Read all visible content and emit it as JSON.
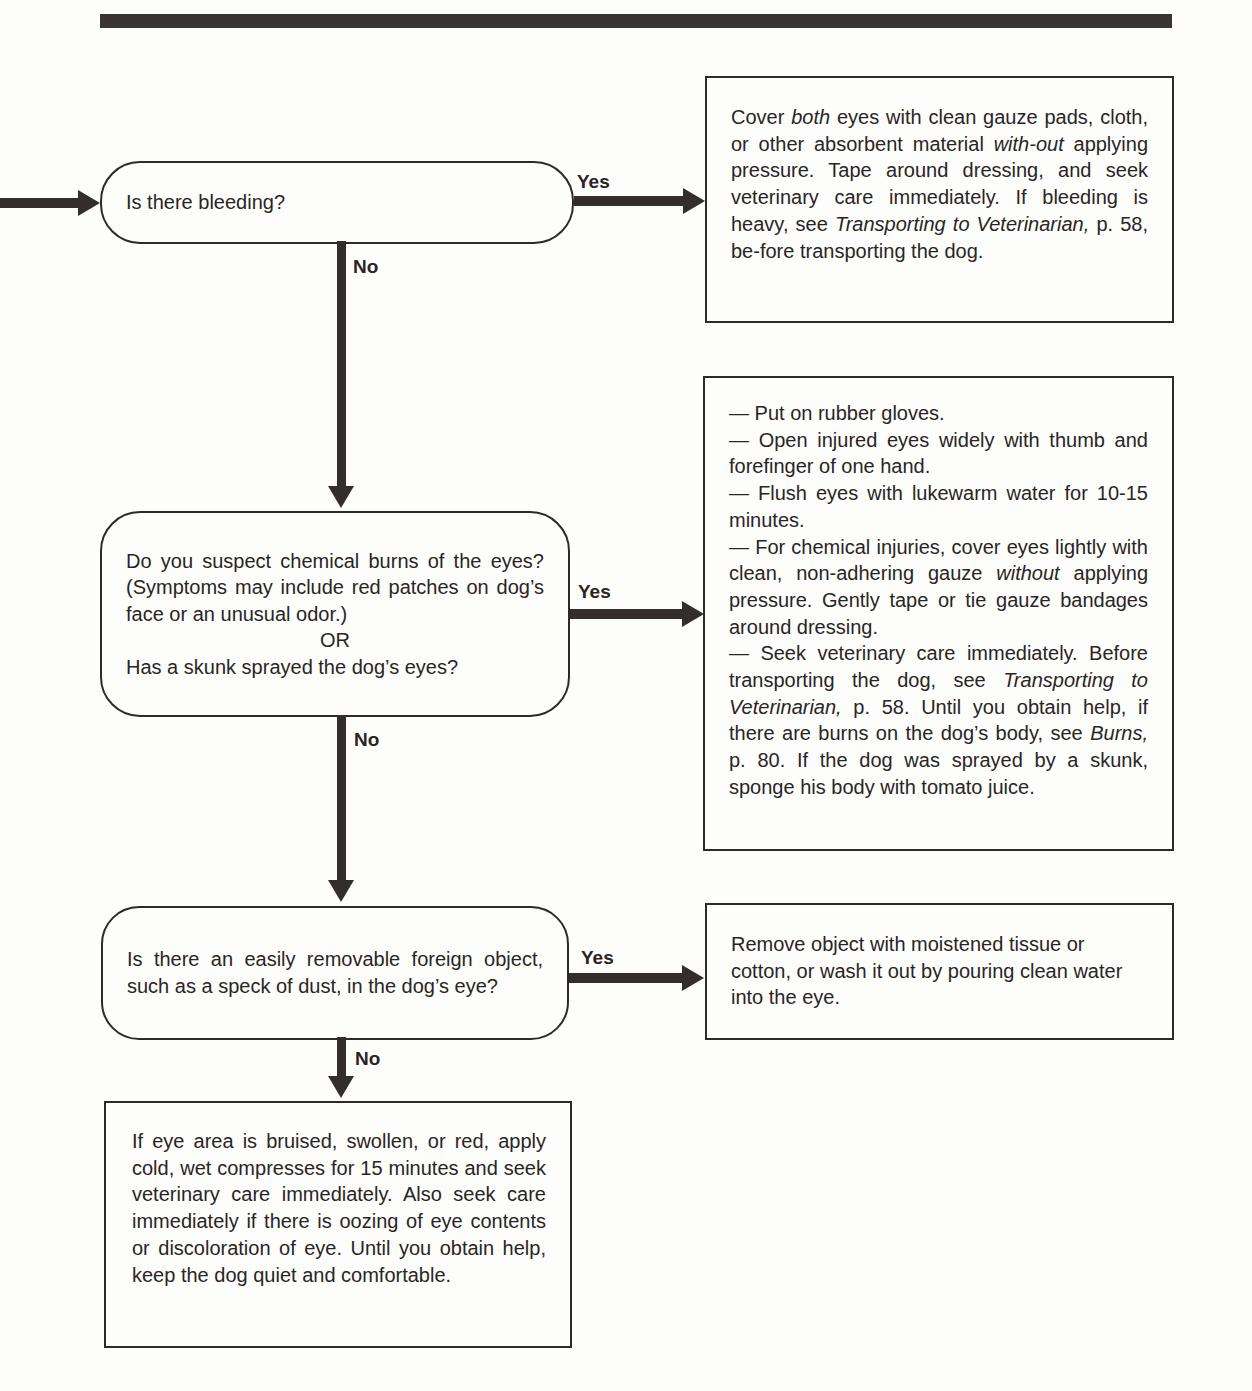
{
  "colors": {
    "ink": "#2e2a29",
    "paper": "#fdfdfb"
  },
  "decisions": [
    {
      "id": "bleeding",
      "question": "Is there bleeding?",
      "yes_label": "Yes",
      "no_label": "No"
    },
    {
      "id": "chemical",
      "question_lines": [
        "Do you suspect chemical burns of the eyes? (Symptoms may include red patches on dog’s face or an unusual odor.)"
      ],
      "or_label": "OR",
      "question_2": "Has a skunk sprayed the dog’s eyes?",
      "yes_label": "Yes",
      "no_label": "No"
    },
    {
      "id": "foreign-object",
      "question": "Is there an easily removable foreign object, such as a speck of dust, in the dog’s eye?",
      "question_hyph": [
        "Is there an easily removable foreign ob-",
        "ject, such as a speck of dust, in the",
        "dog’s eye?"
      ],
      "yes_label": "Yes",
      "no_label": "No"
    }
  ],
  "actions": {
    "bleeding_yes": {
      "p1": "Cover ",
      "p1_em": "both",
      "p2": " eyes with clean gauze pads, cloth, or other absorbent material ",
      "p2_em": "with-out",
      "p3": " applying pressure. Tape around dressing, and seek veterinary care immediately. If bleeding is heavy, see ",
      "p3_em": "Transporting to Veterinarian,",
      "p4": " p. 58, be-fore transporting the dog."
    },
    "chemical_yes": {
      "step1": "— Put on rubber gloves.",
      "step2": "— Open injured eyes widely with thumb and forefinger of one hand.",
      "step3": "— Flush eyes with lukewarm water for 10-15 minutes.",
      "step4_a": "— For chemical injuries, cover eyes lightly with clean, non-adhering gauze ",
      "step4_em": "without",
      "step4_b": " applying pressure. Gently tape or tie gauze bandages around dressing.",
      "step5_a": "— Seek veterinary care immediately. Before transporting the dog, see ",
      "step5_em1": "Transporting to Veterinarian,",
      "step5_b": " p. 58. Until you obtain help, if there are burns on the dog’s body, see ",
      "step5_em2": "Burns,",
      "step5_c": " p. 80. If the dog was sprayed by a skunk, sponge his body with tomato juice."
    },
    "foreign_object_yes": "Remove object with moistened tissue or cotton, or wash it out by pouring clean water into the eye.",
    "foreign_object_no": "If eye area is bruised, swollen, or red, apply cold, wet compresses for 15 minutes and seek veterinary care immediately. Also seek care immediately if there is oozing of eye contents or discoloration of eye. Until you obtain help, keep the dog quiet and comfortable."
  }
}
